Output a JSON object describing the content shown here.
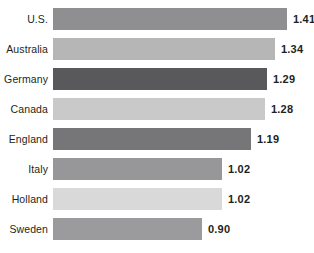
{
  "chart_data": {
    "type": "bar",
    "orientation": "horizontal",
    "title": "",
    "subtitle": "",
    "xlabel": "",
    "ylabel": "",
    "grid": false,
    "legend": "none",
    "xlim": [
      0,
      1.5
    ],
    "categories": [
      "U.S.",
      "Australia",
      "Germany",
      "Canada",
      "England",
      "Italy",
      "Holland",
      "Sweden"
    ],
    "values": [
      1.41,
      1.34,
      1.29,
      1.28,
      1.19,
      1.02,
      1.02,
      0.9
    ],
    "value_labels": [
      "1.41",
      "1.34",
      "1.29",
      "1.28",
      "1.19",
      "1.02",
      "1.02",
      "0.90"
    ],
    "bar_colors": [
      "#8f8f91",
      "#b6b6b7",
      "#59595b",
      "#c9c9ca",
      "#767678",
      "#97979a",
      "#d9d9da",
      "#9b9b9d"
    ],
    "bars": [
      {
        "category": "U.S.",
        "value": 1.41,
        "label": "1.41",
        "color": "#8f8f91"
      },
      {
        "category": "Australia",
        "value": 1.34,
        "label": "1.34",
        "color": "#b6b6b7"
      },
      {
        "category": "Germany",
        "value": 1.29,
        "label": "1.29",
        "color": "#59595b"
      },
      {
        "category": "Canada",
        "value": 1.28,
        "label": "1.28",
        "color": "#c9c9ca"
      },
      {
        "category": "England",
        "value": 1.19,
        "label": "1.19",
        "color": "#767678"
      },
      {
        "category": "Italy",
        "value": 1.02,
        "label": "1.02",
        "color": "#97979a"
      },
      {
        "category": "Holland",
        "value": 1.02,
        "label": "1.02",
        "color": "#d9d9da"
      },
      {
        "category": "Sweden",
        "value": 0.9,
        "label": "0.90",
        "color": "#9b9b9d"
      }
    ]
  },
  "style": {
    "background": "#ffffff",
    "text_color": "#231f20",
    "bar_left_px": 53,
    "bar_height_px": 22,
    "row_pitch_px": 30,
    "first_row_top_px": 8,
    "px_per_unit": 166,
    "label_gap_px": 6
  }
}
